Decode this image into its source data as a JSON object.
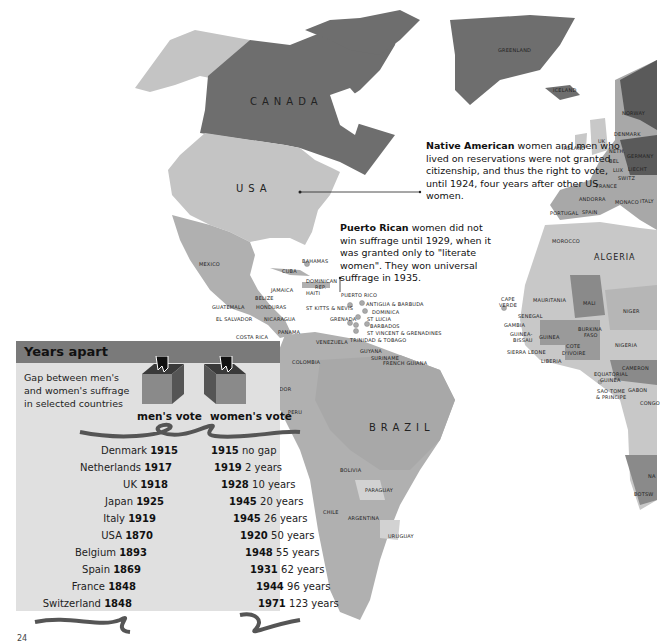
{
  "map": {
    "regions": {
      "canada": "CANADA",
      "usa": "USA",
      "greenland": "GREENLAND",
      "iceland": "ICELAND",
      "mexico": "MEXICO",
      "brazil": "BRAZIL",
      "algeria": "ALGERIA"
    },
    "labels": [
      {
        "text": "BAHAMAS",
        "x": 302,
        "y": 258
      },
      {
        "text": "CUBA",
        "x": 282,
        "y": 268
      },
      {
        "text": "DOMINICAN",
        "x": 306,
        "y": 278
      },
      {
        "text": "REP.",
        "x": 315,
        "y": 284
      },
      {
        "text": "JAMAICA",
        "x": 271,
        "y": 287
      },
      {
        "text": "HAITI",
        "x": 306,
        "y": 290
      },
      {
        "text": "PUERTO RICO",
        "x": 341,
        "y": 292
      },
      {
        "text": "BELIZE",
        "x": 255,
        "y": 295
      },
      {
        "text": "HONDURAS",
        "x": 256,
        "y": 304
      },
      {
        "text": "GUATEMALA",
        "x": 212,
        "y": 304
      },
      {
        "text": "ST KITTS & NEVIS",
        "x": 306,
        "y": 305
      },
      {
        "text": "ANTIGUA & BARBUDA",
        "x": 366,
        "y": 301
      },
      {
        "text": "DOMINICA",
        "x": 372,
        "y": 309
      },
      {
        "text": "NICARAGUA",
        "x": 264,
        "y": 316
      },
      {
        "text": "EL SALVADOR",
        "x": 216,
        "y": 316
      },
      {
        "text": "GRENADA",
        "x": 330,
        "y": 316
      },
      {
        "text": "ST LUCIA",
        "x": 367,
        "y": 316
      },
      {
        "text": "BARBADOS",
        "x": 370,
        "y": 323
      },
      {
        "text": "ST VINCENT & GRENADINES",
        "x": 367,
        "y": 330
      },
      {
        "text": "PANAMA",
        "x": 278,
        "y": 329
      },
      {
        "text": "COSTA RICA",
        "x": 236,
        "y": 334
      },
      {
        "text": "TRINIDAD & TOBAGO",
        "x": 350,
        "y": 337
      },
      {
        "text": "VENEZUELA",
        "x": 316,
        "y": 339
      },
      {
        "text": "GUYANA",
        "x": 360,
        "y": 348
      },
      {
        "text": "SURINAME",
        "x": 371,
        "y": 355
      },
      {
        "text": "FRENCH GUIANA",
        "x": 383,
        "y": 360
      },
      {
        "text": "COLOMBIA",
        "x": 292,
        "y": 359
      },
      {
        "text": "ECUADOR",
        "x": 265,
        "y": 386
      },
      {
        "text": "PERU",
        "x": 288,
        "y": 409
      },
      {
        "text": "BOLIVIA",
        "x": 340,
        "y": 467
      },
      {
        "text": "PARAGUAY",
        "x": 365,
        "y": 487
      },
      {
        "text": "CHILE",
        "x": 323,
        "y": 509
      },
      {
        "text": "ARGENTINA",
        "x": 348,
        "y": 515
      },
      {
        "text": "URUGUAY",
        "x": 388,
        "y": 533
      },
      {
        "text": "NORWAY",
        "x": 622,
        "y": 110
      },
      {
        "text": "IRELAND",
        "x": 562,
        "y": 145
      },
      {
        "text": "UK",
        "x": 598,
        "y": 138
      },
      {
        "text": "DENMARK",
        "x": 614,
        "y": 131
      },
      {
        "text": "NETH.",
        "x": 609,
        "y": 148
      },
      {
        "text": "GERMANY",
        "x": 627,
        "y": 153
      },
      {
        "text": "BEL",
        "x": 609,
        "y": 158
      },
      {
        "text": "LUX",
        "x": 613,
        "y": 167
      },
      {
        "text": "LIECHT",
        "x": 628,
        "y": 166
      },
      {
        "text": "SWITZ",
        "x": 618,
        "y": 175
      },
      {
        "text": "FRANCE",
        "x": 596,
        "y": 183
      },
      {
        "text": "ANDORRA",
        "x": 579,
        "y": 196
      },
      {
        "text": "MONACO",
        "x": 615,
        "y": 199
      },
      {
        "text": "ITALY",
        "x": 640,
        "y": 198
      },
      {
        "text": "PORTUGAL",
        "x": 550,
        "y": 210
      },
      {
        "text": "SPAIN",
        "x": 582,
        "y": 209
      },
      {
        "text": "MOROCCO",
        "x": 552,
        "y": 238
      },
      {
        "text": "CAPE",
        "x": 501,
        "y": 296
      },
      {
        "text": "VERDE",
        "x": 499,
        "y": 302
      },
      {
        "text": "MAURITANIA",
        "x": 533,
        "y": 297
      },
      {
        "text": "MALI",
        "x": 583,
        "y": 300
      },
      {
        "text": "NIGER",
        "x": 623,
        "y": 308
      },
      {
        "text": "SENEGAL",
        "x": 518,
        "y": 313
      },
      {
        "text": "GAMBIA",
        "x": 504,
        "y": 322
      },
      {
        "text": "GUINEA-",
        "x": 510,
        "y": 331
      },
      {
        "text": "BISSAU",
        "x": 513,
        "y": 337
      },
      {
        "text": "GUINEA",
        "x": 539,
        "y": 334
      },
      {
        "text": "BURKINA",
        "x": 578,
        "y": 326
      },
      {
        "text": "FASO",
        "x": 584,
        "y": 332
      },
      {
        "text": "SIERRA LEONE",
        "x": 507,
        "y": 349
      },
      {
        "text": "COTE",
        "x": 566,
        "y": 343
      },
      {
        "text": "D'IVOIRE",
        "x": 562,
        "y": 350
      },
      {
        "text": "NIGERIA",
        "x": 615,
        "y": 342
      },
      {
        "text": "LIBERIA",
        "x": 541,
        "y": 358
      },
      {
        "text": "CAMERON",
        "x": 622,
        "y": 365
      },
      {
        "text": "EQUATORIAL",
        "x": 594,
        "y": 371
      },
      {
        "text": "GUINEA",
        "x": 600,
        "y": 377
      },
      {
        "text": "GABON",
        "x": 628,
        "y": 387
      },
      {
        "text": "SAO TOME",
        "x": 597,
        "y": 388
      },
      {
        "text": "& PRINCIPE",
        "x": 596,
        "y": 394
      },
      {
        "text": "CONGO",
        "x": 640,
        "y": 400
      },
      {
        "text": "BOTSW",
        "x": 634,
        "y": 491
      },
      {
        "text": "NA",
        "x": 648,
        "y": 473
      }
    ]
  },
  "notes": {
    "native_american": {
      "bold": "Native American",
      "rest": " women and men who lived on reservations were not granted citizenship, and thus the right to vote, until 1924, four years after other US women."
    },
    "puerto_rico": {
      "bold": "Puerto Rican",
      "rest": " women did not win suffrage until 1929, when it was granted only to \"literate women\". They won universal suffrage in 1935."
    }
  },
  "panel": {
    "title": "Years apart",
    "subtitle_lines": [
      "Gap between men's",
      "and women's suffrage",
      "in selected countries"
    ],
    "men_header": "men's vote",
    "women_header": "women's vote"
  },
  "chart_data": {
    "type": "table",
    "title": "Years apart",
    "subtitle": "Gap between men's and women's suffrage in selected countries",
    "columns": [
      "Country",
      "Men's vote",
      "Women's vote",
      "Gap"
    ],
    "rows": [
      {
        "country": "Denmark",
        "men": 1915,
        "women": 1915,
        "gap": "no gap"
      },
      {
        "country": "Netherlands",
        "men": 1917,
        "women": 1919,
        "gap": "2 years"
      },
      {
        "country": "UK",
        "men": 1918,
        "women": 1928,
        "gap": "10 years"
      },
      {
        "country": "Japan",
        "men": 1925,
        "women": 1945,
        "gap": "20 years"
      },
      {
        "country": "Italy",
        "men": 1919,
        "women": 1945,
        "gap": "26 years"
      },
      {
        "country": "USA",
        "men": 1870,
        "women": 1920,
        "gap": "50 years"
      },
      {
        "country": "Belgium",
        "men": 1893,
        "women": 1948,
        "gap": "55 years"
      },
      {
        "country": "Spain",
        "men": 1869,
        "women": 1931,
        "gap": "62 years"
      },
      {
        "country": "France",
        "men": 1848,
        "women": 1944,
        "gap": "96 years"
      },
      {
        "country": "Switzerland",
        "men": 1848,
        "women": 1971,
        "gap": "123 years"
      }
    ]
  },
  "page_number": "24",
  "colors": {
    "canada": "#6e6e6e",
    "usa": "#c4c4c4",
    "latin_america": "#b0b0b0",
    "europe_dark": "#5a5a5a",
    "africa_light": "#c8c8c8",
    "panel_bg": "#e0e0e0",
    "panel_header": "#7a7a7a"
  }
}
